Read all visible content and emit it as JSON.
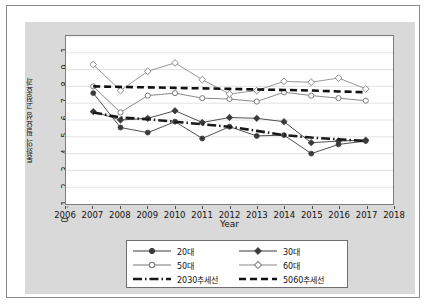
{
  "chart_data": {
    "type": "line",
    "title": "",
    "xlabel": "Year",
    "ylabel": "통화의 필요성 고정효과",
    "xlim": [
      2006,
      2018
    ],
    "ylim": [
      0,
      1
    ],
    "grid": true,
    "legend_position": "bottom",
    "x": [
      2007,
      2008,
      2009,
      2010,
      2011,
      2012,
      2013,
      2014,
      2015,
      2016,
      2017
    ],
    "xticklabels": [
      "2006",
      "2007",
      "2008",
      "2009",
      "2010",
      "2011",
      "2012",
      "2013",
      "2014",
      "2015",
      "2016",
      "2017",
      "2018"
    ],
    "yticklabels": [
      "0",
      ".1",
      ".2",
      ".3",
      ".4",
      ".5",
      ".6",
      ".7",
      ".8",
      ".9",
      "1"
    ],
    "ytickvalues": [
      0,
      0.1,
      0.2,
      0.3,
      0.4,
      0.5,
      0.6,
      0.7,
      0.8,
      0.9,
      1
    ],
    "series": [
      {
        "name": "20대",
        "marker": "filled-circle",
        "style": "solid",
        "color": "#3a3a3a",
        "values": [
          0.66,
          0.455,
          0.425,
          0.49,
          0.39,
          0.46,
          0.405,
          0.41,
          0.3,
          0.355,
          0.375
        ]
      },
      {
        "name": "30대",
        "marker": "filled-diamond",
        "style": "solid",
        "color": "#3a3a3a",
        "values": [
          0.55,
          0.5,
          0.51,
          0.555,
          0.485,
          0.515,
          0.51,
          0.49,
          0.365,
          0.375,
          0.38
        ]
      },
      {
        "name": "50대",
        "marker": "hollow-circle",
        "style": "solid",
        "color": "#7a7a7a",
        "values": [
          0.7,
          0.545,
          0.645,
          0.66,
          0.63,
          0.625,
          0.61,
          0.665,
          0.645,
          0.63,
          0.615
        ]
      },
      {
        "name": "60대",
        "marker": "hollow-diamond",
        "style": "solid",
        "color": "#8a8a8a",
        "values": [
          0.83,
          0.675,
          0.79,
          0.84,
          0.74,
          0.655,
          0.675,
          0.73,
          0.725,
          0.75,
          0.685
        ]
      },
      {
        "name": "2030추세선",
        "marker": "none",
        "style": "dash-dot",
        "color": "#1a1a1a",
        "values": [
          0.545,
          0.515,
          0.505,
          0.49,
          0.475,
          0.46,
          0.435,
          0.41,
          0.395,
          0.385,
          0.375
        ]
      },
      {
        "name": "5060추세선",
        "marker": "none",
        "style": "dashed",
        "color": "#111111",
        "values": [
          0.7,
          0.697,
          0.694,
          0.691,
          0.688,
          0.685,
          0.682,
          0.679,
          0.675,
          0.67,
          0.665
        ]
      }
    ]
  },
  "legend": {
    "items": [
      {
        "label": "20대",
        "symbol": "filled-circle-line"
      },
      {
        "label": "30대",
        "symbol": "filled-diamond-line"
      },
      {
        "label": "50대",
        "symbol": "hollow-circle-line"
      },
      {
        "label": "60대",
        "symbol": "hollow-diamond-line"
      },
      {
        "label": "2030추세선",
        "symbol": "dash-dot-line"
      },
      {
        "label": "5060추세선",
        "symbol": "dashed-line"
      }
    ]
  },
  "colors": {
    "panel": "#d9d9d9",
    "plot_background": "#ffffff",
    "grid": "#e3e3e3",
    "axis": "#7d7d7d",
    "text": "#111111"
  }
}
